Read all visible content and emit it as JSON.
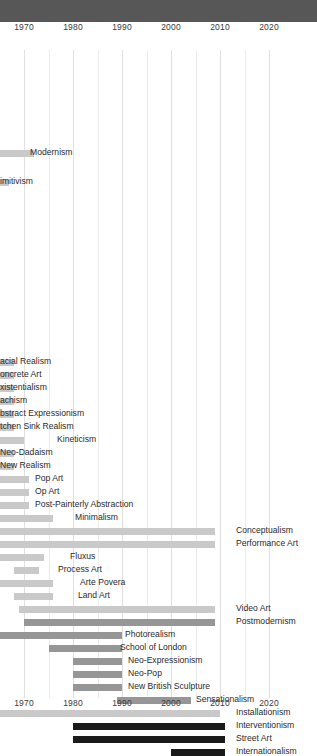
{
  "header": {
    "title": ""
  },
  "chart_data": {
    "type": "bar",
    "orientation": "horizontal-gantt",
    "xlabel": "",
    "ylabel": "",
    "xlim": [
      1967,
      2024
    ],
    "grid": true,
    "grid_interval": 5,
    "legend": "none",
    "note": "View is horizontally cropped at the left edge; bars and labels of earlier movements are clipped.",
    "axis": {
      "tick_labels": [
        "1970",
        "1980",
        "1990",
        "2000",
        "2010",
        "2020"
      ],
      "tick_values": [
        1970,
        1980,
        1990,
        2000,
        2010,
        2020
      ],
      "top_axis": true,
      "bottom_axis": true
    },
    "colors": {
      "tier_light": "#c9c9c9",
      "tier_mid": "#969696",
      "tier_dark": "#1a1a1a",
      "header_bar": "#575757",
      "gridline": "#ebebeb",
      "text": "#2b2b2b"
    },
    "bars": [
      {
        "label": "Modernism",
        "start": 1967,
        "end": 1972,
        "tier": "light",
        "label_side": "right",
        "clipped_left": true,
        "clipped_label": false
      },
      {
        "label": "imitivism",
        "start": 1967,
        "end": 1967,
        "tier": "light",
        "label_side": "left",
        "clipped_left": true,
        "clipped_label": true
      },
      {
        "label": "acial Realism",
        "start": 1967,
        "end": 1968,
        "tier": "light",
        "label_side": "left",
        "clipped_left": true,
        "clipped_label": true
      },
      {
        "label": "oncrete Art",
        "start": 1967,
        "end": 1968,
        "tier": "light",
        "label_side": "left",
        "clipped_left": true,
        "clipped_label": true
      },
      {
        "label": "xistentialism",
        "start": 1967,
        "end": 1968,
        "tier": "light",
        "label_side": "left",
        "clipped_left": true,
        "clipped_label": true
      },
      {
        "label": "achism",
        "start": 1967,
        "end": 1968,
        "tier": "light",
        "label_side": "left",
        "clipped_left": true,
        "clipped_label": true
      },
      {
        "label": "bstract Expressionism",
        "start": 1967,
        "end": 1968,
        "tier": "light",
        "label_side": "left",
        "clipped_left": true,
        "clipped_label": true
      },
      {
        "label": "tchen Sink Realism",
        "start": 1967,
        "end": 1968,
        "tier": "light",
        "label_side": "left",
        "clipped_left": true,
        "clipped_label": true
      },
      {
        "label": "Kineticism",
        "start": 1967,
        "end": 1970,
        "tier": "light",
        "label_side": "right",
        "clipped_left": true,
        "clipped_label": false
      },
      {
        "label": "Neo-Dadaism",
        "start": 1967,
        "end": 1968,
        "tier": "light",
        "label_side": "left",
        "clipped_left": true,
        "clipped_label": false
      },
      {
        "label": "New Realism",
        "start": 1967,
        "end": 1968,
        "tier": "light",
        "label_side": "left",
        "clipped_left": true,
        "clipped_label": false
      },
      {
        "label": "Pop Art",
        "start": 1967,
        "end": 1971,
        "tier": "light",
        "label_side": "right",
        "clipped_left": true,
        "clipped_label": false
      },
      {
        "label": "Op Art",
        "start": 1967,
        "end": 1971,
        "tier": "light",
        "label_side": "right",
        "clipped_left": true,
        "clipped_label": false
      },
      {
        "label": "Post-Painterly Abstraction",
        "start": 1967,
        "end": 1971,
        "tier": "light",
        "label_side": "right",
        "clipped_left": true,
        "clipped_label": false
      },
      {
        "label": "Minimalism",
        "start": 1967,
        "end": 1976,
        "tier": "light",
        "label_side": "right",
        "clipped_left": true,
        "clipped_label": false
      },
      {
        "label": "Conceptualism",
        "start": 1967,
        "end": 2009,
        "tier": "light",
        "label_side": "right",
        "clipped_left": true,
        "clipped_label": false
      },
      {
        "label": "Performance Art",
        "start": 1967,
        "end": 2009,
        "tier": "light",
        "label_side": "right",
        "clipped_left": true,
        "clipped_label": false
      },
      {
        "label": "Fluxus",
        "start": 1967,
        "end": 1974,
        "tier": "light",
        "label_side": "right",
        "clipped_left": true,
        "clipped_label": false
      },
      {
        "label": "Process Art",
        "start": 1968,
        "end": 1973,
        "tier": "light",
        "label_side": "right",
        "clipped_left": false,
        "clipped_label": false
      },
      {
        "label": "Arte Povera",
        "start": 1967,
        "end": 1976,
        "tier": "light",
        "label_side": "right",
        "clipped_left": true,
        "clipped_label": false
      },
      {
        "label": "Land Art",
        "start": 1968,
        "end": 1976,
        "tier": "light",
        "label_side": "right",
        "clipped_left": false,
        "clipped_label": false
      },
      {
        "label": "Video Art",
        "start": 1969,
        "end": 2009,
        "tier": "light",
        "label_side": "right",
        "clipped_left": false,
        "clipped_label": false
      },
      {
        "label": "Postmodernism",
        "start": 1970,
        "end": 2009,
        "tier": "mid",
        "label_side": "right",
        "clipped_left": false,
        "clipped_label": false
      },
      {
        "label": "Photorealism",
        "start": 1967,
        "end": 1990,
        "tier": "mid",
        "label_side": "right",
        "clipped_left": true,
        "clipped_label": false
      },
      {
        "label": "School of London",
        "start": 1975,
        "end": 1990,
        "tier": "mid",
        "label_side": "right",
        "clipped_left": false,
        "clipped_label": false
      },
      {
        "label": "Neo-Expressionism",
        "start": 1980,
        "end": 1990,
        "tier": "mid",
        "label_side": "right",
        "clipped_left": false,
        "clipped_label": false
      },
      {
        "label": "Neo-Pop",
        "start": 1980,
        "end": 1990,
        "tier": "mid",
        "label_side": "right",
        "clipped_left": false,
        "clipped_label": false
      },
      {
        "label": "New British Sculpture",
        "start": 1980,
        "end": 1990,
        "tier": "mid",
        "label_side": "right",
        "clipped_left": false,
        "clipped_label": false
      },
      {
        "label": "Sensationalism",
        "start": 1989,
        "end": 2004,
        "tier": "mid",
        "label_side": "right",
        "clipped_left": false,
        "clipped_label": false
      },
      {
        "label": "Installationism",
        "start": 1967,
        "end": 2010,
        "tier": "light",
        "label_side": "right",
        "clipped_left": true,
        "clipped_label": false
      },
      {
        "label": "Interventionism",
        "start": 1980,
        "end": 2011,
        "tier": "dark",
        "label_side": "right",
        "clipped_left": false,
        "clipped_label": false
      },
      {
        "label": "Street Art",
        "start": 1980,
        "end": 2011,
        "tier": "dark",
        "label_side": "right",
        "clipped_left": false,
        "clipped_label": false
      },
      {
        "label": "Internationalism",
        "start": 2000,
        "end": 2011,
        "tier": "dark",
        "label_side": "right",
        "clipped_left": false,
        "clipped_label": false
      }
    ],
    "bar_rows": [
      {
        "y": 128,
        "label_x": 30,
        "label_y": 125
      },
      {
        "y": 157,
        "label_x": 0,
        "label_y": 154
      },
      {
        "y": 337,
        "label_x": 0,
        "label_y": 334
      },
      {
        "y": 350,
        "label_x": 0,
        "label_y": 347
      },
      {
        "y": 363,
        "label_x": 0,
        "label_y": 360
      },
      {
        "y": 376,
        "label_x": 0,
        "label_y": 373
      },
      {
        "y": 389,
        "label_x": 0,
        "label_y": 386
      },
      {
        "y": 402,
        "label_x": 0,
        "label_y": 399
      },
      {
        "y": 415,
        "label_x": 57,
        "label_y": 412
      },
      {
        "y": 428,
        "label_x": 0,
        "label_y": 425
      },
      {
        "y": 441,
        "label_x": 0,
        "label_y": 438
      },
      {
        "y": 454,
        "label_x": 35,
        "label_y": 451
      },
      {
        "y": 467,
        "label_x": 35,
        "label_y": 464
      },
      {
        "y": 480,
        "label_x": 35,
        "label_y": 477
      },
      {
        "y": 493,
        "label_x": 75,
        "label_y": 490
      },
      {
        "y": 506,
        "label_x": 236,
        "label_y": 503
      },
      {
        "y": 519,
        "label_x": 236,
        "label_y": 516
      },
      {
        "y": 532,
        "label_x": 70,
        "label_y": 529
      },
      {
        "y": 545,
        "label_x": 58,
        "label_y": 542
      },
      {
        "y": 558,
        "label_x": 80,
        "label_y": 555
      },
      {
        "y": 571,
        "label_x": 78,
        "label_y": 568
      },
      {
        "y": 584,
        "label_x": 236,
        "label_y": 581
      },
      {
        "y": 597,
        "label_x": 236,
        "label_y": 594
      },
      {
        "y": 610,
        "label_x": 125,
        "label_y": 607
      },
      {
        "y": 623,
        "label_x": 120,
        "label_y": 620
      },
      {
        "y": 636,
        "label_x": 128,
        "label_y": 633
      },
      {
        "y": 649,
        "label_x": 128,
        "label_y": 646
      },
      {
        "y": 662,
        "label_x": 128,
        "label_y": 659
      },
      {
        "y": 675,
        "label_x": 196,
        "label_y": 672
      },
      {
        "y": 688,
        "label_x": 236,
        "label_y": 685
      },
      {
        "y": 701,
        "label_x": 236,
        "label_y": 698
      },
      {
        "y": 714,
        "label_x": 236,
        "label_y": 711
      },
      {
        "y": 727,
        "label_x": 236,
        "label_y": 724
      }
    ]
  }
}
